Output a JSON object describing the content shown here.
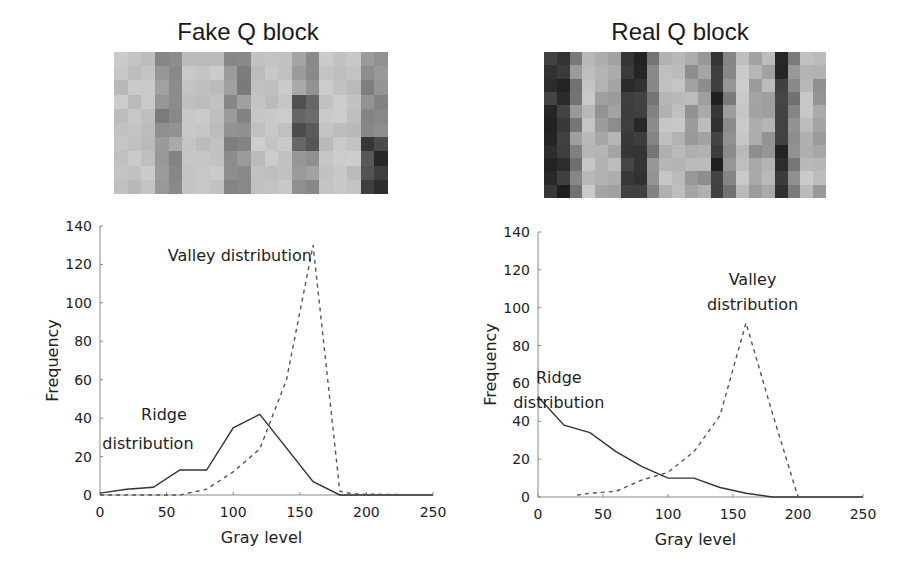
{
  "panels": [
    {
      "title": "Fake Q block"
    },
    {
      "title": "Real Q block"
    }
  ],
  "chart_data": [
    {
      "type": "line",
      "title": "Fake Q block",
      "xlabel": "Gray level",
      "ylabel": "Frequency",
      "xlim": [
        0,
        250
      ],
      "ylim": [
        0,
        140
      ],
      "xticks": [
        0,
        50,
        100,
        150,
        200,
        250
      ],
      "yticks": [
        0,
        20,
        40,
        60,
        80,
        100,
        120,
        140
      ],
      "grid": false,
      "series": [
        {
          "name": "Ridge distribution",
          "style": "solid",
          "x": [
            0,
            20,
            40,
            60,
            80,
            100,
            120,
            160,
            180,
            250
          ],
          "y": [
            1,
            3,
            4,
            13,
            13,
            35,
            42,
            7,
            0,
            0
          ]
        },
        {
          "name": "Valley distribution",
          "style": "dashed",
          "x": [
            0,
            60,
            80,
            100,
            120,
            140,
            160,
            180,
            190,
            250
          ],
          "y": [
            0,
            0,
            3,
            12,
            24,
            60,
            130,
            2,
            0.5,
            0
          ]
        }
      ],
      "annotations": [
        {
          "text": "Valley distribution",
          "x": 105,
          "y": 122
        },
        {
          "text": "Ridge",
          "x": 48,
          "y": 39
        },
        {
          "text": "distribution",
          "x": 36,
          "y": 24
        }
      ]
    },
    {
      "type": "line",
      "title": "Real Q block",
      "xlabel": "Gray level",
      "ylabel": "Frequency",
      "xlim": [
        0,
        250
      ],
      "ylim": [
        0,
        140
      ],
      "xticks": [
        0,
        50,
        100,
        150,
        200,
        250
      ],
      "yticks": [
        0,
        20,
        40,
        60,
        80,
        100,
        120,
        140
      ],
      "grid": false,
      "series": [
        {
          "name": "Ridge distribution",
          "style": "solid",
          "x": [
            0,
            20,
            40,
            60,
            80,
            100,
            120,
            140,
            160,
            180,
            250
          ],
          "y": [
            53,
            38,
            34,
            24,
            16,
            10,
            10,
            5,
            2,
            0,
            0
          ]
        },
        {
          "name": "Valley distribution",
          "style": "dashed",
          "x": [
            30,
            40,
            60,
            80,
            100,
            120,
            140,
            160,
            180,
            200
          ],
          "y": [
            1,
            2,
            3,
            9,
            13,
            24,
            43,
            92,
            45,
            0
          ]
        }
      ],
      "annotations": [
        {
          "text": "Valley",
          "x": 165,
          "y": 112
        },
        {
          "text": "distribution",
          "x": 165,
          "y": 99
        },
        {
          "text": "Ridge",
          "x": 16,
          "y": 60
        },
        {
          "text": "distribution",
          "x": 16,
          "y": 47
        }
      ]
    }
  ]
}
